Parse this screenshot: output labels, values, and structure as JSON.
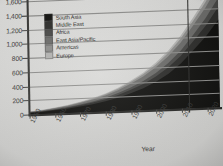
{
  "chart_data": {
    "type": "area",
    "title": "",
    "xlabel": "Year",
    "ylabel": "",
    "xlim": [
      1950,
      2025
    ],
    "ylim": [
      0,
      1600
    ],
    "grid": true,
    "legend_position": "top-left",
    "x_ticks": [
      "1950",
      "1960",
      "1970",
      "1980",
      "1990",
      "2000",
      "2010",
      "2020"
    ],
    "y_ticks": [
      "0",
      "200",
      "400",
      "600",
      "800",
      "1,000",
      "1,200",
      "1,400",
      "1,600"
    ],
    "x": [
      1950,
      1955,
      1960,
      1965,
      1970,
      1975,
      1980,
      1985,
      1990,
      1995,
      2000,
      2005,
      2010,
      2015,
      2020,
      2025
    ],
    "stacked": true,
    "series": [
      {
        "name": "South Asia",
        "color": "#121210",
        "values": [
          20,
          30,
          45,
          62,
          85,
          110,
          145,
          190,
          245,
          310,
          395,
          500,
          640,
          820,
          1010,
          1240
        ]
      },
      {
        "name": "Middle East",
        "color": "#2e2e2c",
        "values": [
          5,
          7,
          10,
          14,
          18,
          24,
          30,
          38,
          48,
          60,
          74,
          90,
          108,
          128,
          150,
          175
        ]
      },
      {
        "name": "Africa",
        "color": "#4a4a48",
        "values": [
          4,
          5,
          7,
          9,
          12,
          16,
          20,
          26,
          33,
          41,
          50,
          62,
          75,
          90,
          108,
          128
        ]
      },
      {
        "name": "East Asia/Pacific",
        "color": "#6d6d6b",
        "values": [
          6,
          8,
          11,
          15,
          20,
          26,
          33,
          42,
          52,
          64,
          78,
          94,
          110,
          128,
          146,
          166
        ]
      },
      {
        "name": "Americas",
        "color": "#8f8f8d",
        "values": [
          4,
          5,
          6,
          8,
          10,
          13,
          16,
          20,
          25,
          31,
          38,
          46,
          55,
          64,
          74,
          85
        ]
      },
      {
        "name": "Europe",
        "color": "#b5b5b3",
        "values": [
          3,
          4,
          5,
          6,
          8,
          10,
          12,
          15,
          19,
          23,
          28,
          34,
          40,
          47,
          54,
          62
        ]
      }
    ],
    "annotations": [
      {
        "text": "Projected",
        "x": 2016,
        "kind": "vertical-line-label"
      }
    ]
  },
  "axis": {
    "x_title": "Year",
    "y_ticks": [
      "1,600",
      "1,400",
      "1,200",
      "1,000",
      "800",
      "600",
      "400",
      "200",
      "0"
    ],
    "x_ticks": [
      "1950",
      "1960",
      "1970",
      "1980",
      "1990",
      "2000",
      "2010",
      "2020"
    ]
  },
  "legend": {
    "items": [
      {
        "label": "South Asia",
        "color": "#121210"
      },
      {
        "label": "Middle East",
        "color": "#2e2e2c"
      },
      {
        "label": "Africa",
        "color": "#4a4a48"
      },
      {
        "label": "East Asia/Pacific",
        "color": "#6d6d6b"
      },
      {
        "label": "Americas",
        "color": "#8f8f8d"
      },
      {
        "label": "Europe",
        "color": "#b5b5b3"
      }
    ]
  },
  "annotation": {
    "projected_label": "Projected"
  }
}
